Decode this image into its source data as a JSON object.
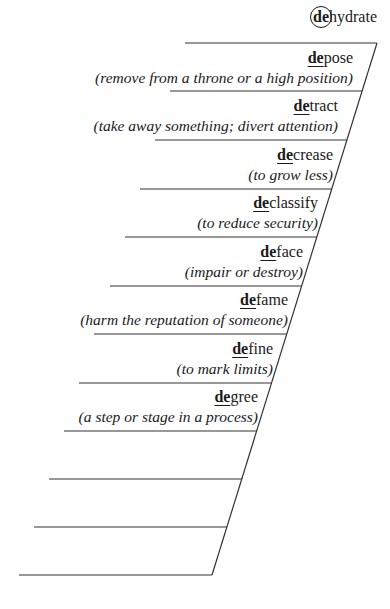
{
  "header": {
    "prefix": "de",
    "rest": "hydrate"
  },
  "entries": [
    {
      "prefix": "de",
      "rest": "pose",
      "definition": "(remove from a throne or a high position)"
    },
    {
      "prefix": "de",
      "rest": "tract",
      "definition": "(take away something; divert attention)"
    },
    {
      "prefix": "de",
      "rest": "crease",
      "definition": "(to grow less)"
    },
    {
      "prefix": "de",
      "rest": "classify",
      "definition": "(to reduce security)"
    },
    {
      "prefix": "de",
      "rest": "face",
      "definition": "(impair or destroy)"
    },
    {
      "prefix": "de",
      "rest": "fame",
      "definition": "(harm the reputation of someone)"
    },
    {
      "prefix": "de",
      "rest": "fine",
      "definition": "(to mark limits)"
    },
    {
      "prefix": "de",
      "rest": "gree",
      "definition": "(a step or stage in a process)"
    }
  ],
  "blank_rows": 3
}
